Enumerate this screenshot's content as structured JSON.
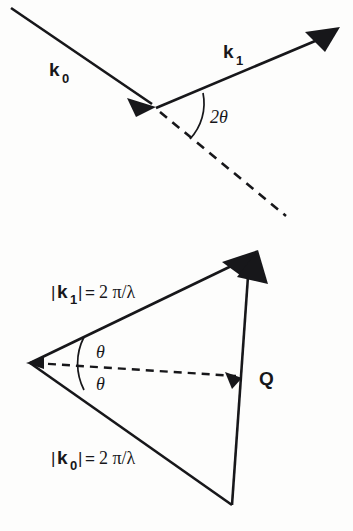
{
  "figure": {
    "background_color": "#fdfdfc",
    "ink_color": "#17171a"
  },
  "panels": [
    {
      "id": "top",
      "name": "scattering-geometry",
      "labels": {
        "incident_vector": {
          "symbol": "k",
          "subscript": "0"
        },
        "scattered_vector": {
          "symbol": "k",
          "subscript": "1"
        },
        "angle": "2θ"
      }
    },
    {
      "id": "bottom",
      "name": "momentum-transfer-triangle",
      "labels": {
        "k1_magnitude": {
          "bar_open": "|",
          "symbol": "k",
          "subscript": "1",
          "bar_close": "|",
          "equals": "=",
          "value": "2 π/λ",
          "full": "|k₁| = 2π/λ"
        },
        "k0_magnitude": {
          "bar_open": "|",
          "symbol": "k",
          "subscript": "0",
          "bar_close": "|",
          "equals": "=",
          "value": "2 π/λ",
          "full": "|k₀| = 2π/λ"
        },
        "angle_upper": "θ",
        "angle_lower": "θ",
        "transfer_vector": "Q"
      }
    }
  ]
}
